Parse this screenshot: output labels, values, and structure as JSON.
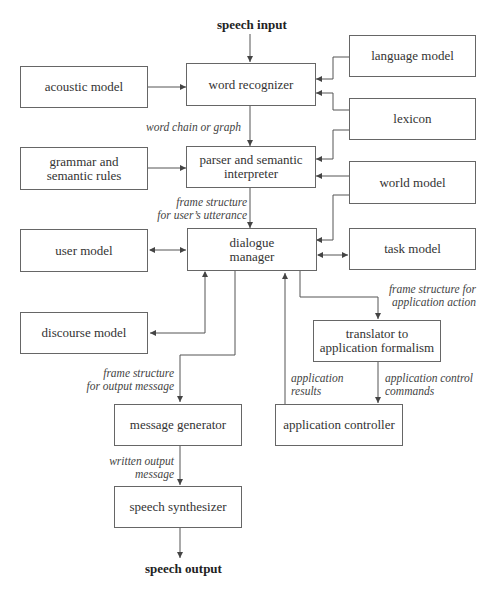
{
  "io": {
    "input": "speech input",
    "output": "speech output"
  },
  "boxes": {
    "word_recognizer": "word recognizer",
    "acoustic_model": "acoustic model",
    "language_model": "language model",
    "lexicon": "lexicon",
    "grammar_rules_1": "grammar and",
    "grammar_rules_2": "semantic rules",
    "parser_1": "parser and semantic",
    "parser_2": "interpreter",
    "world_model": "world model",
    "user_model": "user model",
    "dialogue_manager_1": "dialogue",
    "dialogue_manager_2": "manager",
    "task_model": "task model",
    "discourse_model": "discourse model",
    "translator_1": "translator to",
    "translator_2": "application formalism",
    "message_generator": "message generator",
    "application_controller": "application controller",
    "speech_synthesizer": "speech synthesizer"
  },
  "edge_labels": {
    "word_chain": "word chain or graph",
    "frame_user_1": "frame structure",
    "frame_user_2": "for user’s utterance",
    "frame_app_1": "frame structure for",
    "frame_app_2": "application action",
    "frame_out_1": "frame structure",
    "frame_out_2": "for output message",
    "app_results_1": "application",
    "app_results_2": "results",
    "app_control_1": "application control",
    "app_control_2": "commands",
    "written_1": "written output",
    "written_2": "message"
  }
}
